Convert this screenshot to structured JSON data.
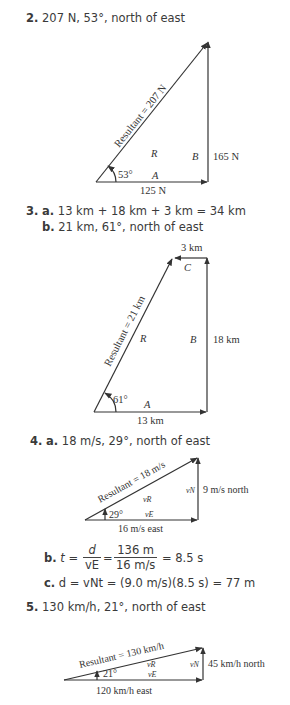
{
  "problems": [
    {
      "number": "2.",
      "answer": "207 N, 53°, north of east",
      "figure": {
        "resultant_label": "Resultant = 207 N",
        "R": "R",
        "A": "A",
        "B": "B",
        "angle": "53°",
        "bottom_label": "125 N",
        "right_label": "165 N"
      }
    },
    {
      "number": "3.",
      "parts": [
        {
          "letter": "a.",
          "text": "13 km + 18 km + 3 km = 34 km"
        },
        {
          "letter": "b.",
          "text": "21 km, 61°, north of east"
        }
      ],
      "figure": {
        "resultant_label": "Resultant = 21 km",
        "R": "R",
        "A": "A",
        "B": "B",
        "C": "C",
        "angle": "61°",
        "bottom_label": "13 km",
        "right_label": "18 km",
        "top_label": "3 km"
      }
    },
    {
      "number": "4.",
      "parts": [
        {
          "letter": "a.",
          "text": "18 m/s, 29°, north of east"
        },
        {
          "letter": "b.",
          "lhs": "t =",
          "frac1_num": "d",
          "frac1_den": "vE",
          "eq": "=",
          "frac2_num": "136 m",
          "frac2_den": "16 m/s",
          "result": "= 8.5 s"
        },
        {
          "letter": "c.",
          "text": "d = vNt = (9.0 m/s)(8.5 s) = 77 m"
        }
      ],
      "figure": {
        "resultant_label": "Resultant = 18 m/s",
        "vR": "vR",
        "vE": "vE",
        "vN": "vN",
        "angle": "29°",
        "bottom_label": "16 m/s east",
        "right_label": "9 m/s north"
      }
    },
    {
      "number": "5.",
      "answer": "130 km/h, 21°, north of east",
      "figure": {
        "resultant_label": "Resultant = 130 km/h",
        "vR": "vR",
        "vE": "vE",
        "vN": "vN",
        "angle": "21°",
        "bottom_label": "120 km/h east",
        "right_label": "45 km/h north"
      }
    }
  ]
}
